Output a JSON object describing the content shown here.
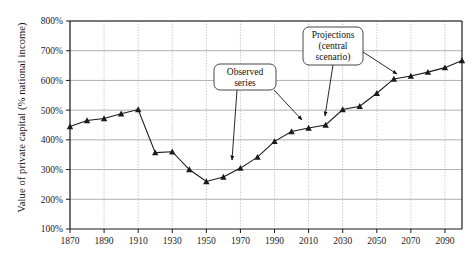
{
  "chart_data": {
    "type": "line",
    "title": "",
    "subtitle": "",
    "xlabel": "",
    "ylabel": "Value of private capital (% national income)",
    "xlim": [
      1870,
      2100
    ],
    "ylim": [
      100,
      800
    ],
    "ytick_labels": [
      "800%",
      "700%",
      "600%",
      "500%",
      "400%",
      "300%",
      "200%",
      "100%"
    ],
    "ytick_values": [
      800,
      700,
      600,
      500,
      400,
      300,
      200,
      100
    ],
    "xtick_labels": [
      "1870",
      "1890",
      "1910",
      "1930",
      "1950",
      "1970",
      "1990",
      "2010",
      "2030",
      "2050",
      "2070",
      "2090"
    ],
    "xtick_values": [
      1870,
      1890,
      1910,
      1930,
      1950,
      1970,
      1990,
      2010,
      2030,
      2050,
      2070,
      2090
    ],
    "grid": "horizontal solid gridlines; vertical dotted gridlines at x ticks",
    "legend_position": "none",
    "marker": "filled triangle",
    "line_color": "#1a1a1a",
    "grid_color": "#9a9a9a",
    "x": [
      1870,
      1880,
      1890,
      1900,
      1910,
      1920,
      1930,
      1940,
      1950,
      1960,
      1970,
      1980,
      1990,
      2000,
      2010,
      2020,
      2030,
      2040,
      2050,
      2060,
      2070,
      2080,
      2090,
      2100
    ],
    "series": [
      {
        "name": "Value of private capital (% national income)",
        "values": [
          445,
          465,
          472,
          488,
          502,
          357,
          360,
          300,
          260,
          275,
          305,
          342,
          395,
          428,
          440,
          450,
          502,
          513,
          557,
          605,
          615,
          628,
          643,
          667
        ]
      }
    ],
    "annotations": [
      {
        "id": "observed-series",
        "lines": [
          "Observed",
          "series"
        ],
        "box_x": 214,
        "box_y": 64,
        "box_w": 62,
        "box_h": 26,
        "arrows": [
          {
            "x1": 237,
            "y1": 90,
            "x2": 232,
            "y2": 160
          },
          {
            "x1": 274,
            "y1": 90,
            "x2": 302,
            "y2": 120
          }
        ]
      },
      {
        "id": "projections-central-scenario",
        "lines": [
          "Projections",
          "(central",
          "scenario)"
        ],
        "box_x": 303,
        "box_y": 27,
        "box_w": 60,
        "box_h": 38,
        "arrows": [
          {
            "x1": 333,
            "y1": 65,
            "x2": 325,
            "y2": 116
          },
          {
            "x1": 363,
            "y1": 52,
            "x2": 397,
            "y2": 74
          }
        ]
      }
    ]
  }
}
